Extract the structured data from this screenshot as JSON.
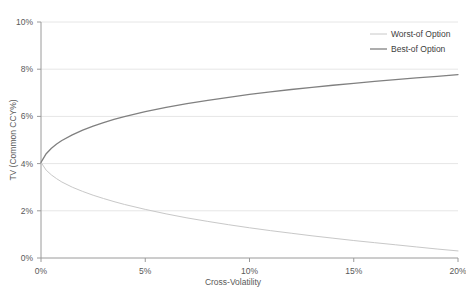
{
  "chart_data": {
    "type": "line",
    "title": "",
    "xlabel": "Cross-Volatility",
    "ylabel": "TV (Common CCY%)",
    "xlim": [
      0,
      20
    ],
    "ylim": [
      0,
      10
    ],
    "grid": true,
    "grid_axis": "y",
    "legend_position": "top-right",
    "x_tick_labels": [
      "0%",
      "5%",
      "10%",
      "15%",
      "20%"
    ],
    "x_tick_values": [
      0,
      5,
      10,
      15,
      20
    ],
    "y_tick_labels": [
      "0%",
      "2%",
      "4%",
      "6%",
      "8%",
      "10%"
    ],
    "y_tick_values": [
      0,
      2,
      4,
      6,
      8,
      10
    ],
    "x": [
      0,
      0.25,
      0.5,
      0.75,
      1,
      1.5,
      2,
      2.5,
      3,
      3.5,
      4,
      5,
      6,
      7,
      8,
      9,
      10,
      11,
      12,
      13,
      14,
      15,
      16,
      17,
      18,
      19,
      20
    ],
    "series": [
      {
        "name": "Worst-of Option",
        "color": "#c8c8c8",
        "width": 1,
        "values": [
          4.05,
          3.72,
          3.52,
          3.36,
          3.22,
          3.0,
          2.82,
          2.66,
          2.52,
          2.39,
          2.27,
          2.06,
          1.87,
          1.7,
          1.55,
          1.41,
          1.28,
          1.16,
          1.05,
          0.94,
          0.84,
          0.74,
          0.65,
          0.56,
          0.47,
          0.38,
          0.3
        ]
      },
      {
        "name": "Best-of Option",
        "color": "#808080",
        "width": 1.3,
        "values": [
          4.05,
          4.42,
          4.65,
          4.83,
          4.98,
          5.22,
          5.42,
          5.59,
          5.74,
          5.87,
          5.99,
          6.2,
          6.38,
          6.54,
          6.68,
          6.81,
          6.93,
          7.04,
          7.14,
          7.23,
          7.32,
          7.4,
          7.48,
          7.56,
          7.63,
          7.7,
          7.77
        ]
      }
    ]
  },
  "legend": {
    "entries": [
      {
        "label": "Worst-of Option"
      },
      {
        "label": "Best-of Option"
      }
    ]
  },
  "colors": {
    "gridline": "#e6e6e6",
    "axis": "#9a9a9a",
    "text": "#595959"
  }
}
